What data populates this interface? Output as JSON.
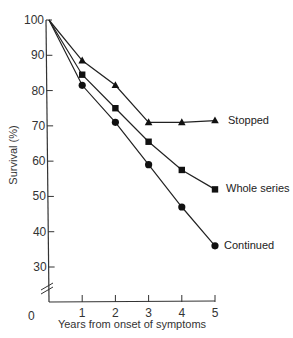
{
  "chart_data": {
    "type": "line",
    "title": "",
    "xlabel": "Years from onset of symptoms",
    "ylabel": "Survival (%)",
    "x": [
      0,
      1,
      2,
      3,
      4,
      5
    ],
    "xlim": [
      0,
      5
    ],
    "ylim": [
      25,
      100
    ],
    "y_axis_break": true,
    "x_ticks": [
      "0",
      "1",
      "2",
      "3",
      "4",
      "5"
    ],
    "y_ticks": [
      "30",
      "40",
      "50",
      "60",
      "70",
      "80",
      "90",
      "100"
    ],
    "grid": false,
    "legend": "inline labels at line ends",
    "series": [
      {
        "name": "Stopped",
        "marker": "triangle",
        "values": [
          100,
          88.5,
          81.5,
          71,
          71,
          71.5
        ]
      },
      {
        "name": "Whole series",
        "marker": "square",
        "values": [
          100,
          84.5,
          75,
          65.5,
          57.5,
          52
        ]
      },
      {
        "name": "Continued",
        "marker": "circle",
        "values": [
          100,
          81.5,
          71,
          59,
          47,
          36
        ]
      }
    ]
  },
  "labels": {
    "x_origin": "0",
    "xlabel": "Years from onset of symptoms",
    "ylabel": "Survival (%)",
    "series_stopped": "Stopped",
    "series_whole": "Whole series",
    "series_continued": "Continued"
  }
}
